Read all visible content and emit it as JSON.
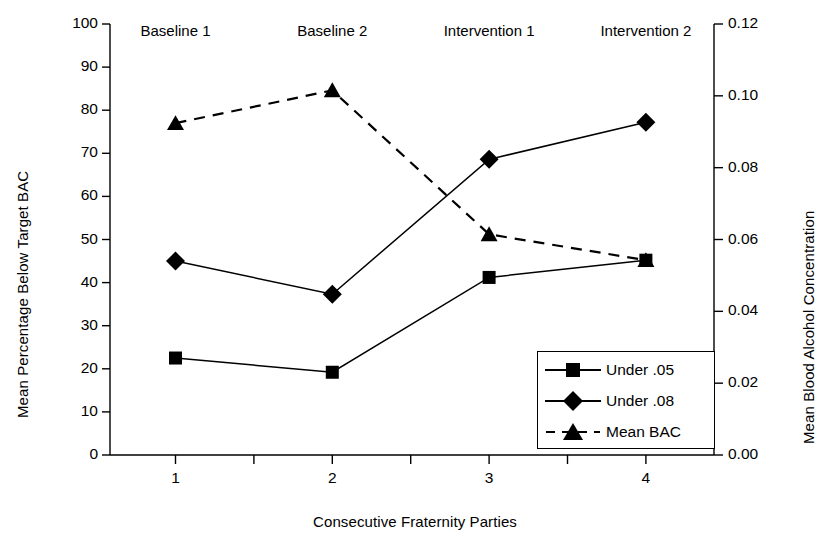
{
  "chart_data": {
    "type": "line",
    "title": "",
    "xlabel": "Consecutive Fraternity Parties",
    "ylabel": "Mean Percentage Below Target BAC",
    "ylabel_right": "Mean Blood Alcohol Concentration",
    "x": [
      1,
      2,
      3,
      4
    ],
    "xtick_labels": [
      "1",
      "2",
      "3",
      "4"
    ],
    "ylim": [
      0,
      100
    ],
    "yticks": [
      0,
      10,
      20,
      30,
      40,
      50,
      60,
      70,
      80,
      90,
      100
    ],
    "ytick_labels": [
      "0",
      "10",
      "20",
      "30",
      "40",
      "50",
      "60",
      "70",
      "80",
      "90",
      "100"
    ],
    "ylim_right": [
      0.0,
      0.12
    ],
    "yticks_right": [
      0.0,
      0.02,
      0.04,
      0.06,
      0.08,
      0.1,
      0.12
    ],
    "ytick_labels_right": [
      "0.00",
      "0.02",
      "0.04",
      "0.06",
      "0.08",
      "0.10",
      "0.12"
    ],
    "grid": false,
    "legend_position": "lower right",
    "phase_labels": [
      "Baseline 1",
      "Baseline 2",
      "Intervention 1",
      "Intervention 2"
    ],
    "series": [
      {
        "name": "Under .05",
        "marker": "square",
        "linestyle": "solid",
        "axis": "left",
        "values": [
          22.5,
          19.2,
          41.2,
          45.2
        ]
      },
      {
        "name": "Under .08",
        "marker": "diamond",
        "linestyle": "solid",
        "axis": "left",
        "values": [
          45.0,
          37.3,
          68.6,
          77.2
        ]
      },
      {
        "name": "Mean BAC",
        "marker": "triangle",
        "linestyle": "dashed",
        "axis": "right",
        "values": [
          0.0924,
          0.1015,
          0.0614,
          0.0543
        ],
        "values_left_scale": [
          77.0,
          84.6,
          51.2,
          45.2
        ]
      }
    ],
    "colors": {
      "line": "#000000",
      "marker": "#000000",
      "background": "#ffffff",
      "axis": "#000000"
    }
  },
  "legend": {
    "items": [
      {
        "label": "Under .05"
      },
      {
        "label": "Under .08"
      },
      {
        "label": "Mean BAC"
      }
    ]
  }
}
